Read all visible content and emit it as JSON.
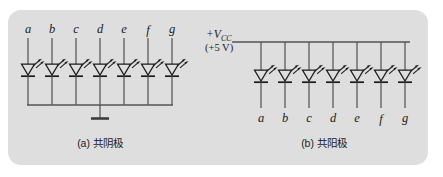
{
  "figure": {
    "background_color": "#dedede",
    "page_color": "#ffffff",
    "wire_color": "#4a4a4a",
    "symbol_color": "#1d1d1d",
    "diagrams": [
      {
        "id": "a",
        "caption": "(a) 共阴极",
        "type": "common-cathode",
        "segment_labels": [
          "a",
          "b",
          "c",
          "d",
          "e",
          "f",
          "g"
        ],
        "label_position": "top",
        "led_count": 7,
        "led_symbol": "light-emitting-diode",
        "common_rail": "ground",
        "ground_symbol": "earth-ground",
        "supply_label": null
      },
      {
        "id": "b",
        "caption": "(b) 共阳极",
        "type": "common-anode",
        "segment_labels": [
          "a",
          "b",
          "c",
          "d",
          "e",
          "f",
          "g"
        ],
        "label_position": "bottom",
        "led_count": 7,
        "led_symbol": "light-emitting-diode",
        "common_rail": "supply",
        "ground_symbol": null,
        "supply_label": {
          "prefix": "+V",
          "subscript": "CC",
          "voltage": "(+5 V)"
        }
      }
    ]
  }
}
